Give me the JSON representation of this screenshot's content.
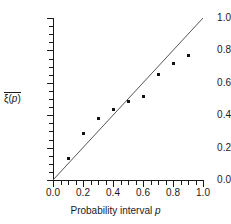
{
  "chart_data": {
    "type": "scatter",
    "title": "",
    "xlabel": "Probability interval p",
    "ylabel": "ξ̄(p)",
    "xlim": [
      0.0,
      1.0
    ],
    "ylim": [
      0.0,
      1.0
    ],
    "grid": false,
    "legend": null,
    "x": [
      0.1,
      0.2,
      0.3,
      0.4,
      0.5,
      0.6,
      0.7,
      0.8,
      0.9
    ],
    "values": [
      0.135,
      0.285,
      0.38,
      0.435,
      0.485,
      0.515,
      0.65,
      0.72,
      0.77
    ],
    "series": [
      {
        "name": "mean calibration",
        "x": [
          0.1,
          0.2,
          0.3,
          0.4,
          0.5,
          0.6,
          0.7,
          0.8,
          0.9
        ],
        "values": [
          0.135,
          0.285,
          0.38,
          0.435,
          0.485,
          0.515,
          0.65,
          0.72,
          0.77
        ],
        "marker": "filled-square",
        "color": "#111111"
      },
      {
        "name": "identity reference line",
        "type": "line",
        "x": [
          0.0,
          1.0
        ],
        "values": [
          0.0,
          1.0
        ],
        "color": "#555555"
      }
    ],
    "xticks": [
      0.0,
      0.2,
      0.4,
      0.6,
      0.8,
      1.0
    ],
    "yticks": [
      0.0,
      0.2,
      0.4,
      0.6,
      0.8,
      1.0
    ],
    "xtick_labels": [
      "0.0",
      "0.2",
      "0.4",
      "0.6",
      "0.8",
      "1.0"
    ],
    "ytick_labels": [
      "0.0",
      "0.2",
      "0.4",
      "0.6",
      "0.8",
      "1.0"
    ],
    "xticks_minor": [
      0.05,
      0.1,
      0.15,
      0.25,
      0.3,
      0.35,
      0.45,
      0.5,
      0.55,
      0.65,
      0.7,
      0.75,
      0.85,
      0.9,
      0.95
    ],
    "yticks_minor": [
      0.05,
      0.1,
      0.15,
      0.25,
      0.3,
      0.35,
      0.45,
      0.5,
      0.55,
      0.65,
      0.7,
      0.75,
      0.85,
      0.9,
      0.95
    ]
  },
  "axis_titles": {
    "x_prefix": "Probability interval ",
    "x_variable": "p",
    "y_symbol": "ξ",
    "y_arg_open": "(",
    "y_variable": "p",
    "y_arg_close": ")"
  },
  "colors": {
    "axis": "#1a1a1a",
    "marker": "#111111",
    "reference_line": "#555555",
    "background": "#ffffff"
  }
}
